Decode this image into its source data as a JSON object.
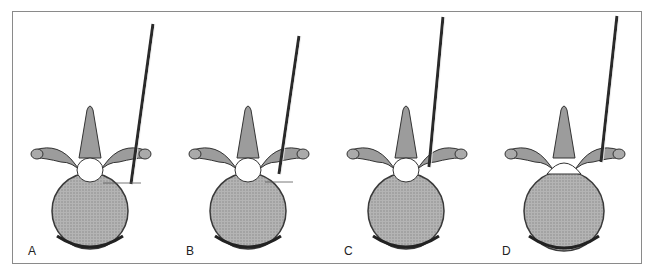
{
  "figure": {
    "panels": [
      {
        "label": "A",
        "left": 0,
        "probe_x1": 140,
        "probe_y1": 12,
        "probe_x2": 118,
        "probe_y2": 172,
        "marker": true,
        "gap_top": true
      },
      {
        "label": "B",
        "left": 158,
        "probe_x1": 128,
        "probe_y1": 24,
        "probe_x2": 108,
        "probe_y2": 162,
        "marker": true,
        "gap_top": true
      },
      {
        "label": "C",
        "left": 316,
        "probe_x1": 114,
        "probe_y1": 5,
        "probe_x2": 100,
        "probe_y2": 155,
        "marker": false,
        "gap_top": true
      },
      {
        "label": "D",
        "left": 474,
        "probe_x1": 130,
        "probe_y1": 4,
        "probe_x2": 114,
        "probe_y2": 150,
        "marker": false,
        "gap_top": false
      }
    ],
    "colors": {
      "frame": "#8a8a8a",
      "bone_body": "#a8a8a8",
      "bone_outline": "#3a3a3a",
      "arch": "#9c9c9c",
      "probe": "#2a2a2a"
    }
  }
}
